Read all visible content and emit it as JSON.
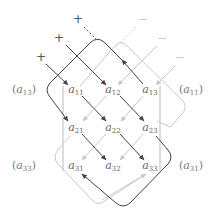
{
  "diagram": {
    "colors": {
      "positive": "#444444",
      "negative": "#c8c8c8",
      "bars": "#bbbbbb",
      "text": "#666666"
    },
    "matrix": {
      "rows": [
        [
          {
            "base": "a",
            "sub": "11"
          },
          {
            "base": "a",
            "sub": "12"
          },
          {
            "base": "a",
            "sub": "13"
          }
        ],
        [
          {
            "base": "a",
            "sub": "21"
          },
          {
            "base": "a",
            "sub": "22"
          },
          {
            "base": "a",
            "sub": "23"
          }
        ],
        [
          {
            "base": "a",
            "sub": "31"
          },
          {
            "base": "a",
            "sub": "32"
          },
          {
            "base": "a",
            "sub": "33"
          }
        ]
      ]
    },
    "side_labels": {
      "left_top": {
        "base": "a",
        "sub": "13"
      },
      "right_top": {
        "base": "a",
        "sub": "11"
      },
      "left_bottom": {
        "base": "a",
        "sub": "33"
      },
      "right_bottom": {
        "base": "a",
        "sub": "31"
      }
    },
    "signs": {
      "plus": [
        "+",
        "+",
        "+"
      ],
      "minus": [
        "−",
        "−",
        "−"
      ]
    }
  }
}
